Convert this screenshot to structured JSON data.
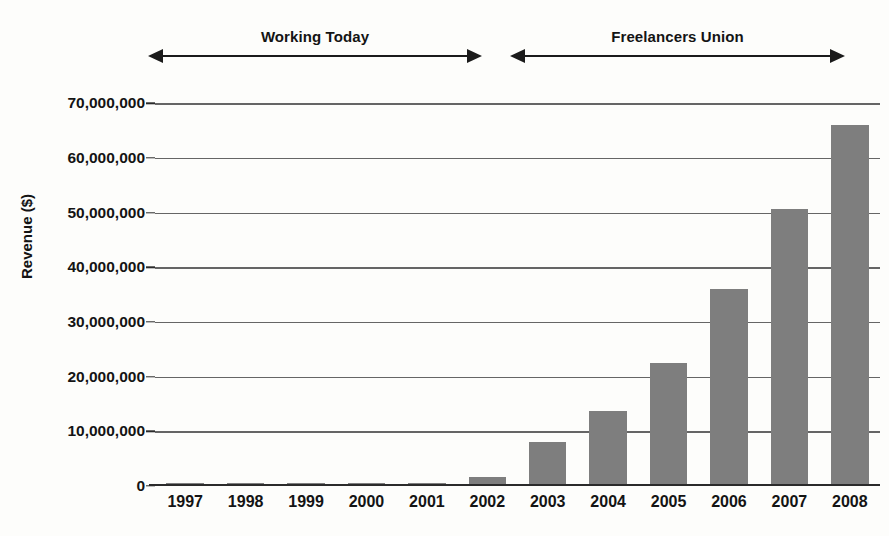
{
  "chart_data": {
    "type": "bar",
    "title": "",
    "xlabel": "",
    "ylabel": "Revenue ($)",
    "categories": [
      "1997",
      "1998",
      "1999",
      "2000",
      "2001",
      "2002",
      "2003",
      "2004",
      "2005",
      "2006",
      "2007",
      "2008"
    ],
    "values": [
      400000,
      420000,
      450000,
      400000,
      380000,
      1700000,
      8000000,
      13700000,
      22500000,
      36000000,
      50700000,
      66000000
    ],
    "ylim": [
      0,
      75000000
    ],
    "ytick_values": [
      0,
      10000000,
      20000000,
      30000000,
      40000000,
      50000000,
      60000000,
      70000000
    ],
    "ytick_labels": [
      "0",
      "10,000,000",
      "20,000,000",
      "30,000,000",
      "40,000,000",
      "50,000,000",
      "60,000,000",
      "70,000,000"
    ],
    "grid": true,
    "legend": "none",
    "bar_color": "#7e7e7e",
    "annotations": [
      {
        "label": "Working Today",
        "style": "double-arrow",
        "span_start_category": "1997",
        "span_end_category": "2002"
      },
      {
        "label": "Freelancers Union",
        "style": "double-arrow",
        "span_start_category": "2003",
        "span_end_category": "2008"
      }
    ]
  },
  "axes": {
    "y_title": "Revenue ($)"
  },
  "annotations": {
    "left_span_label": "Working Today",
    "right_span_label": "Freelancers Union"
  }
}
